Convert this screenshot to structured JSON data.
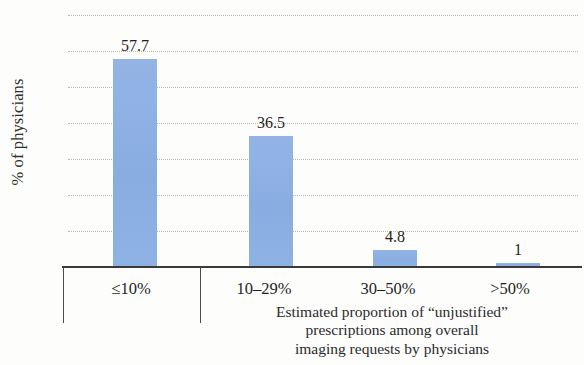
{
  "chart_data": {
    "type": "bar",
    "title": "",
    "subtitle": "",
    "xlabel_lines": [
      "Estimated proportion of “unjustified”",
      "prescriptions among overall",
      "imaging requests by physicians"
    ],
    "xlabel": "Estimated proportion of “unjustified” prescriptions among overall imaging requests by physicians",
    "ylabel": "% of physicians",
    "categories": [
      "≤10%",
      "10–29%",
      "30–50%",
      ">50%"
    ],
    "values": [
      57.7,
      36.5,
      4.8,
      1
    ],
    "value_labels": [
      "57.7",
      "36.5",
      "4.8",
      "1"
    ],
    "ylim": [
      0,
      70
    ],
    "ytick_values": [
      70,
      60,
      50,
      40,
      30,
      20,
      10,
      0
    ],
    "ytick_labels": [
      "70",
      "60",
      "50",
      "40",
      "30",
      "20",
      "10",
      "0"
    ],
    "ytick_step": 10,
    "grid": "horizontal-dotted",
    "legend": "none",
    "series": [
      {
        "name": "% of physicians",
        "values": [
          57.7,
          36.5,
          4.8,
          1
        ]
      }
    ],
    "colors": {
      "bar": "#8fb1e3",
      "gridline": "#b9b9b9",
      "axis": "#3a3a3a",
      "text": "#2b2b2b",
      "background": "#fdfdfb"
    }
  }
}
